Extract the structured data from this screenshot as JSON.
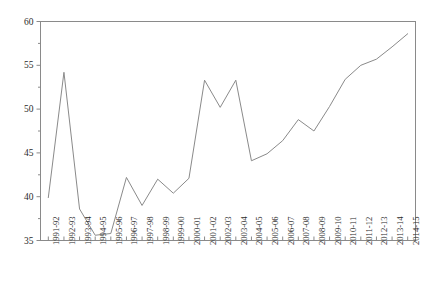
{
  "chart_data": {
    "type": "line",
    "title": "",
    "subtitle": "",
    "xlabel": "",
    "ylabel": "",
    "ylim": [
      35,
      60
    ],
    "yticks": [
      35,
      40,
      45,
      50,
      55,
      60
    ],
    "ytick_labels": [
      "35",
      "40",
      "45",
      "50",
      "55",
      "60"
    ],
    "grid": false,
    "legend": false,
    "legend_position": "none",
    "line_color": "#8a8a8a",
    "line_width": 1,
    "axis_color": "#8a8a8a",
    "background_color": "#ffffff",
    "categories": [
      "1991-92",
      "1992-93",
      "1993-94",
      "1994-95",
      "1995-96",
      "1996-97",
      "1997-98",
      "1998-99",
      "1999-00",
      "2000-01",
      "2001-02",
      "2002-03",
      "2003-04",
      "2004-05",
      "2005-06",
      "2006-07",
      "2007-08",
      "2008-09",
      "2009-10",
      "2010-11",
      "2011-12",
      "2012-13",
      "2013-14",
      "2014-15"
    ],
    "values": [
      39.9,
      54.2,
      38.6,
      35.6,
      35.8,
      42.2,
      39.0,
      42.0,
      40.4,
      42.1,
      53.3,
      50.2,
      53.3,
      44.1,
      44.9,
      46.4,
      48.8,
      47.5,
      50.3,
      53.4,
      55.0,
      55.7,
      57.1,
      58.6
    ],
    "series_name": "series-1"
  }
}
